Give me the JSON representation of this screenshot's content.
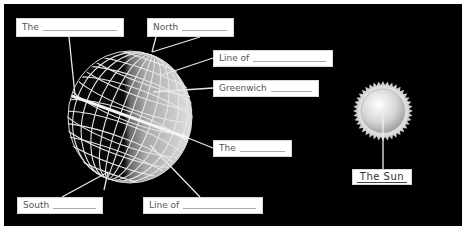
{
  "diagram": {
    "colors": {
      "background": "#000000",
      "label_box": "#ffffff",
      "leader_lines": "#e8e8e8",
      "globe_dark": "#0a0a0a",
      "globe_light": "#d8d8d8"
    },
    "labels": [
      {
        "id": "the-axis",
        "text": "The",
        "blank": true
      },
      {
        "id": "north-pole",
        "text": "North",
        "blank": true
      },
      {
        "id": "line-of-latitude",
        "text": "Line of",
        "blank": true
      },
      {
        "id": "greenwich-meridian",
        "text": "Greenwich",
        "blank": true
      },
      {
        "id": "the-equator",
        "text": "The",
        "blank": true
      },
      {
        "id": "south-pole",
        "text": "South",
        "blank": true
      },
      {
        "id": "line-of-longitude",
        "text": "Line of",
        "blank": true
      }
    ],
    "sun": {
      "label": "The Sun"
    }
  }
}
